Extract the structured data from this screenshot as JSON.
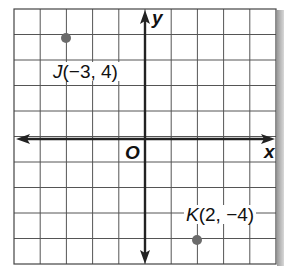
{
  "diagram": {
    "type": "coordinate-plane",
    "grid": {
      "x_min": -5,
      "x_max": 5,
      "y_min": -5,
      "y_max": 5,
      "step": 1
    },
    "axes": {
      "x_label": "x",
      "y_label": "y",
      "origin_label": "O"
    },
    "points": [
      {
        "name": "J",
        "coords": "(−3, 4)",
        "x": -3,
        "y": 4
      },
      {
        "name": "K",
        "coords": "(2, −4)",
        "x": 2,
        "y": -4
      }
    ],
    "colors": {
      "grid": "#555555",
      "axis": "#222222",
      "point": "#6b6b6b",
      "text": "#111111"
    }
  }
}
